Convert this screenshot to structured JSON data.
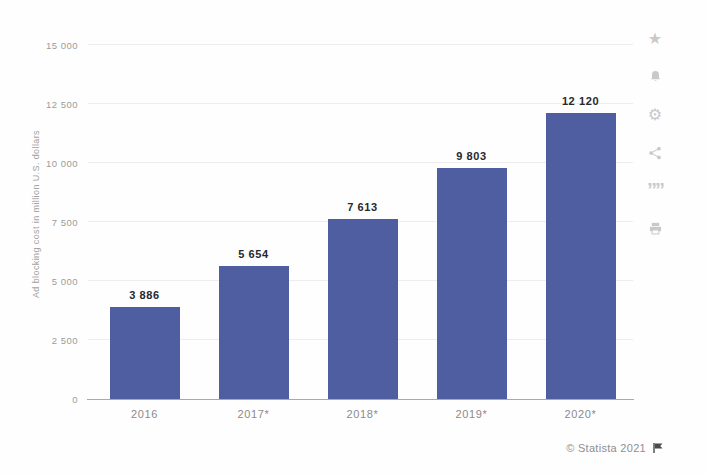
{
  "chart_data": {
    "type": "bar",
    "title": "",
    "xlabel": "",
    "ylabel": "Ad blocking cost in million U.S. dollars",
    "categories": [
      "2016",
      "2017*",
      "2018*",
      "2019*",
      "2020*"
    ],
    "values": [
      3886,
      5654,
      7613,
      9803,
      12120
    ],
    "value_labels": [
      "3 886",
      "5 654",
      "7 613",
      "9 803",
      "12 120"
    ],
    "ylim": [
      0,
      15000
    ],
    "yticks": [
      0,
      2500,
      5000,
      7500,
      10000,
      12500,
      15000
    ],
    "ytick_labels": [
      "0",
      "2 500",
      "5 000",
      "7 500",
      "10 000",
      "12 500",
      "15 000"
    ],
    "grid": true,
    "legend": "none",
    "bar_color": "#4f5da1"
  },
  "toolbar": {
    "icons": [
      {
        "name": "favorite-star-icon"
      },
      {
        "name": "notification-bell-icon"
      },
      {
        "name": "settings-gear-icon"
      },
      {
        "name": "share-icon"
      },
      {
        "name": "citation-quote-icon"
      },
      {
        "name": "print-icon"
      }
    ]
  },
  "footer": {
    "copyright": "© Statista 2021",
    "flag": "report-flag-icon"
  }
}
